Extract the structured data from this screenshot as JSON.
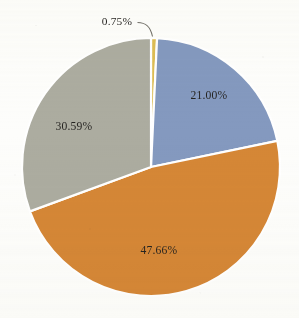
{
  "chart_data": {
    "type": "pie",
    "title": "",
    "subtitle": "",
    "xlabel": "",
    "ylabel": "",
    "legend": "none",
    "grid": false,
    "start_angle_deg": 0,
    "direction": "clockwise",
    "categories": [
      "Series 1",
      "Series 2",
      "Series 3",
      "Series 4"
    ],
    "values": [
      0.75,
      21.0,
      47.66,
      30.59
    ],
    "labels": [
      "0.75%",
      "21.00%",
      "47.66%",
      "30.59%"
    ],
    "colors": [
      "#dcbb4e",
      "#8096bd",
      "#d4832f",
      "#a9a99d"
    ],
    "label_positions": [
      "outside",
      "inside",
      "inside",
      "inside"
    ],
    "slices": [
      {
        "label": "0.75%",
        "value": 0.75,
        "color": "#dcbb4e",
        "position": "outside",
        "leader": true
      },
      {
        "label": "21.00%",
        "value": 21.0,
        "color": "#8096bd",
        "position": "inside",
        "leader": false
      },
      {
        "label": "47.66%",
        "value": 47.66,
        "color": "#d4832f",
        "position": "inside",
        "leader": false
      },
      {
        "label": "30.59%",
        "value": 30.59,
        "color": "#a9a99d",
        "position": "inside",
        "leader": false
      }
    ]
  },
  "geometry": {
    "center_x": 151,
    "center_y": 167,
    "radius": 129,
    "separator_color": "#ffffff",
    "separator_width": 2.2,
    "background": "#fdfdfb"
  },
  "labels": {
    "gold": "0.75%",
    "blue": "21.00%",
    "orange": "47.66%",
    "gray": "30.59%"
  }
}
